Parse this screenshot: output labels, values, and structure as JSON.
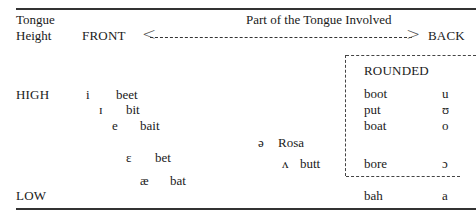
{
  "table": {
    "header": {
      "row_label_line1": "Tongue",
      "row_label_line2": "Height",
      "column_title": "Part of the Tongue Involved",
      "front_label": "FRONT",
      "back_label": "BACK",
      "arrow_left": "<",
      "arrow_right": ">"
    },
    "rows": {
      "high": "HIGH",
      "low": "LOW"
    },
    "front_vowels": [
      {
        "symbol": "i",
        "word": "beet"
      },
      {
        "symbol": "ɪ",
        "word": "bit"
      },
      {
        "symbol": "e",
        "word": "bait"
      },
      {
        "symbol": "ɛ",
        "word": "bet"
      },
      {
        "symbol": "æ",
        "word": "bat"
      }
    ],
    "central_vowels": [
      {
        "symbol": "ə",
        "word": "Rosa"
      },
      {
        "symbol": "ʌ",
        "word": "butt"
      }
    ],
    "rounded_box": {
      "title": "ROUNDED",
      "vowels": [
        {
          "word": "boot",
          "symbol": "u"
        },
        {
          "word": "put",
          "symbol": "ʊ"
        },
        {
          "word": "boat",
          "symbol": "o"
        },
        {
          "word": "bore",
          "symbol": "ɔ"
        }
      ]
    },
    "low_back": {
      "word": "bah",
      "symbol": "a"
    }
  }
}
